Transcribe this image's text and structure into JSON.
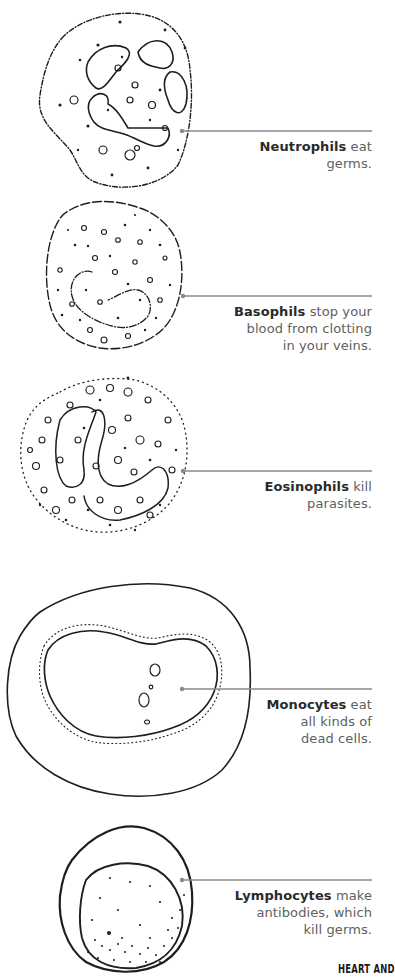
{
  "colors": {
    "ink": "#1e1e1e",
    "leader_line": "#8a8a8a",
    "caption_text": "#606060",
    "caption_bold": "#2a2a2a",
    "background": "#ffffff"
  },
  "cells": [
    {
      "id": "neutrophil",
      "name": "Neutrophils",
      "rest_line1": " eat",
      "rest_line2": "germs.",
      "rest_line3": ""
    },
    {
      "id": "basophil",
      "name": "Basophils",
      "rest_line1": " stop your",
      "rest_line2": "blood from clotting",
      "rest_line3": "in your veins."
    },
    {
      "id": "eosinophil",
      "name": "Eosinophils",
      "rest_line1": " kill",
      "rest_line2": "parasites.",
      "rest_line3": ""
    },
    {
      "id": "monocyte",
      "name": "Monocytes",
      "rest_line1": " eat",
      "rest_line2": "all kinds of",
      "rest_line3": "dead cells."
    },
    {
      "id": "lymphocyte",
      "name": "Lymphocytes",
      "rest_line1": " make",
      "rest_line2": "antibodies, which",
      "rest_line3": "kill germs."
    }
  ],
  "footer": {
    "text": "HEART AND"
  }
}
